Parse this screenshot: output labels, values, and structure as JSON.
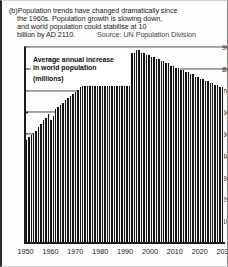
{
  "caption": {
    "line1": "(b)Population trends have changed dramatically since",
    "line2": "the 1960s. Population growth is slowing down,",
    "line3": "and world population could stabilise at 10",
    "line4": "billion by AD 2110.",
    "source": "Source: UN Population Division"
  },
  "inset": {
    "line1": "Average annual increase",
    "line2": "in world population",
    "line3": "(millions)"
  },
  "chart_data": {
    "type": "bar",
    "title": "Average annual increase in world population (millions)",
    "xlabel": "",
    "ylabel": "millions",
    "ylim": [
      0,
      90
    ],
    "xlim": [
      1950,
      2030
    ],
    "grid": true,
    "gridlines": [
      50,
      60,
      70,
      80,
      90
    ],
    "ytick_labels": [
      "10",
      "20",
      "30",
      "40",
      "50",
      "60",
      "70",
      "80",
      "90"
    ],
    "ytick_values": [
      10,
      20,
      30,
      40,
      50,
      60,
      70,
      80,
      90
    ],
    "xtick_labels": [
      "1950",
      "1960",
      "1970",
      "1980",
      "1990",
      "2000",
      "2010",
      "2020",
      "2030"
    ],
    "xtick_values": [
      1950,
      1960,
      1970,
      1980,
      1990,
      2000,
      2010,
      2020,
      2030
    ],
    "legend": [],
    "x": [
      1950,
      1951,
      1952,
      1953,
      1954,
      1955,
      1956,
      1957,
      1958,
      1959,
      1960,
      1961,
      1962,
      1963,
      1964,
      1965,
      1966,
      1967,
      1968,
      1969,
      1970,
      1971,
      1972,
      1973,
      1974,
      1975,
      1976,
      1977,
      1978,
      1979,
      1980,
      1981,
      1982,
      1983,
      1984,
      1985,
      1986,
      1987,
      1988,
      1989,
      1990,
      1991,
      1992,
      1993,
      1994,
      1995,
      1996,
      1997,
      1998,
      1999,
      2000,
      2001,
      2002,
      2003,
      2004,
      2005,
      2006,
      2007,
      2008,
      2009,
      2010,
      2011,
      2012,
      2013,
      2014,
      2015,
      2016,
      2017,
      2018,
      2019,
      2020,
      2021,
      2022,
      2023,
      2024,
      2025,
      2026,
      2027,
      2028,
      2029,
      2030
    ],
    "values": [
      47,
      48,
      49,
      50,
      51,
      53,
      54,
      56,
      57,
      59,
      56,
      58,
      61,
      62,
      63,
      64,
      65,
      66,
      67,
      68,
      69,
      70,
      71,
      72,
      72,
      73,
      73,
      74,
      74,
      75,
      75,
      76,
      77,
      78,
      79,
      80,
      81,
      82,
      83,
      84,
      85,
      86,
      86,
      87,
      87,
      88,
      88,
      87,
      87,
      86,
      86,
      85,
      85,
      84,
      84,
      83,
      83,
      82,
      82,
      81,
      81,
      80,
      80,
      79,
      79,
      78,
      78,
      77,
      77,
      76,
      76,
      75,
      75,
      74,
      74,
      73,
      73,
      72,
      72,
      71,
      71
    ]
  }
}
